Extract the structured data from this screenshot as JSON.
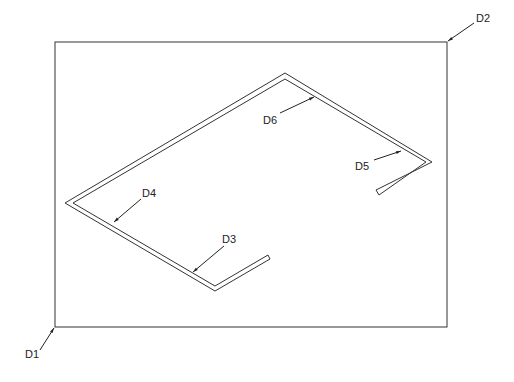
{
  "diagram": {
    "type": "cad-isometric-drawing",
    "colors": {
      "line": "#333333",
      "background": "#ffffff"
    },
    "frame": {
      "x1": 55,
      "y1": 42,
      "x2": 447,
      "y2": 327
    },
    "labels": {
      "d1": "D1",
      "d2": "D2",
      "d3": "D3",
      "d4": "D4",
      "d5": "D5",
      "d6": "D6"
    }
  }
}
